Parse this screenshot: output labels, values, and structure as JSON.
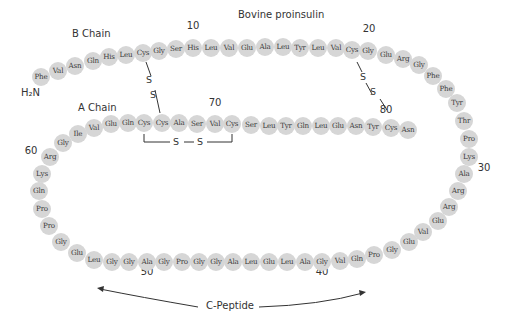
{
  "title": "Bovine proinsulin",
  "labels": {
    "b_chain": "B Chain",
    "a_chain": "A Chain",
    "n_terminus": "H₂N",
    "c_peptide": "C-Peptide",
    "disulfide_atom": "S"
  },
  "position_numbers": [
    {
      "text": "10",
      "x": 193,
      "y": 26
    },
    {
      "text": "20",
      "x": 369,
      "y": 29
    },
    {
      "text": "30",
      "x": 484,
      "y": 168
    },
    {
      "text": "40",
      "x": 322,
      "y": 272
    },
    {
      "text": "50",
      "x": 147,
      "y": 272
    },
    {
      "text": "60",
      "x": 31,
      "y": 151
    },
    {
      "text": "70",
      "x": 215,
      "y": 103
    },
    {
      "text": "80",
      "x": 386,
      "y": 110
    }
  ],
  "residues_outer": [
    {
      "aa": "Phe",
      "x": 41,
      "y": 77
    },
    {
      "aa": "Val",
      "x": 58,
      "y": 71
    },
    {
      "aa": "Asn",
      "x": 75,
      "y": 66
    },
    {
      "aa": "Gln",
      "x": 93,
      "y": 61
    },
    {
      "aa": "His",
      "x": 109,
      "y": 57
    },
    {
      "aa": "Leu",
      "x": 126,
      "y": 55
    },
    {
      "aa": "Cys",
      "x": 143,
      "y": 53
    },
    {
      "aa": "Gly",
      "x": 159,
      "y": 51
    },
    {
      "aa": "Ser",
      "x": 176,
      "y": 49
    },
    {
      "aa": "His",
      "x": 193,
      "y": 48
    },
    {
      "aa": "Leu",
      "x": 211,
      "y": 48
    },
    {
      "aa": "Val",
      "x": 229,
      "y": 48
    },
    {
      "aa": "Glu",
      "x": 247,
      "y": 48
    },
    {
      "aa": "Ala",
      "x": 265,
      "y": 47
    },
    {
      "aa": "Leu",
      "x": 283,
      "y": 47
    },
    {
      "aa": "Tyr",
      "x": 300,
      "y": 48
    },
    {
      "aa": "Leu",
      "x": 318,
      "y": 48
    },
    {
      "aa": "Val",
      "x": 336,
      "y": 48
    },
    {
      "aa": "Cys",
      "x": 352,
      "y": 50
    },
    {
      "aa": "Gly",
      "x": 368,
      "y": 51
    },
    {
      "aa": "Glu",
      "x": 386,
      "y": 55
    },
    {
      "aa": "Arg",
      "x": 403,
      "y": 59
    },
    {
      "aa": "Gly",
      "x": 419,
      "y": 65
    },
    {
      "aa": "Phe",
      "x": 433,
      "y": 76
    },
    {
      "aa": "Phe",
      "x": 446,
      "y": 89
    },
    {
      "aa": "Tyr",
      "x": 457,
      "y": 103
    },
    {
      "aa": "Thr",
      "x": 464,
      "y": 121
    },
    {
      "aa": "Pro",
      "x": 469,
      "y": 139
    },
    {
      "aa": "Lys",
      "x": 469,
      "y": 157
    },
    {
      "aa": "Ala",
      "x": 464,
      "y": 174
    },
    {
      "aa": "Arg",
      "x": 458,
      "y": 191
    },
    {
      "aa": "Arg",
      "x": 449,
      "y": 207
    },
    {
      "aa": "Glu",
      "x": 438,
      "y": 221
    },
    {
      "aa": "Val",
      "x": 423,
      "y": 232
    },
    {
      "aa": "Glu",
      "x": 409,
      "y": 242
    },
    {
      "aa": "Gly",
      "x": 392,
      "y": 250
    },
    {
      "aa": "Pro",
      "x": 374,
      "y": 255
    },
    {
      "aa": "Gln",
      "x": 357,
      "y": 259
    },
    {
      "aa": "Val",
      "x": 340,
      "y": 261
    },
    {
      "aa": "Gly",
      "x": 322,
      "y": 262
    },
    {
      "aa": "Ala",
      "x": 305,
      "y": 262
    },
    {
      "aa": "Leu",
      "x": 287,
      "y": 262
    },
    {
      "aa": "Glu",
      "x": 269,
      "y": 262
    },
    {
      "aa": "Leu",
      "x": 251,
      "y": 262
    },
    {
      "aa": "Ala",
      "x": 233,
      "y": 262
    },
    {
      "aa": "Gly",
      "x": 216,
      "y": 262
    },
    {
      "aa": "Gly",
      "x": 199,
      "y": 262
    },
    {
      "aa": "Pro",
      "x": 182,
      "y": 262
    },
    {
      "aa": "Gly",
      "x": 164,
      "y": 262
    },
    {
      "aa": "Ala",
      "x": 147,
      "y": 262
    },
    {
      "aa": "Gly",
      "x": 129,
      "y": 262
    },
    {
      "aa": "Gly",
      "x": 112,
      "y": 262
    },
    {
      "aa": "Leu",
      "x": 94,
      "y": 260
    },
    {
      "aa": "Glu",
      "x": 77,
      "y": 253
    },
    {
      "aa": "Gly",
      "x": 61,
      "y": 242
    },
    {
      "aa": "Pro",
      "x": 49,
      "y": 226
    },
    {
      "aa": "Pro",
      "x": 42,
      "y": 209
    },
    {
      "aa": "Gln",
      "x": 39,
      "y": 191
    },
    {
      "aa": "Lys",
      "x": 42,
      "y": 174
    },
    {
      "aa": "Arg",
      "x": 50,
      "y": 157
    },
    {
      "aa": "Gly",
      "x": 63,
      "y": 143
    },
    {
      "aa": "Ile",
      "x": 78,
      "y": 134
    }
  ],
  "residues_a_row": [
    {
      "aa": "Val",
      "x": 94,
      "y": 128
    },
    {
      "aa": "Glu",
      "x": 111,
      "y": 124
    },
    {
      "aa": "Gln",
      "x": 128,
      "y": 123
    },
    {
      "aa": "Cys",
      "x": 144,
      "y": 123
    },
    {
      "aa": "Cys",
      "x": 162,
      "y": 123
    },
    {
      "aa": "Ala",
      "x": 179,
      "y": 123
    },
    {
      "aa": "Ser",
      "x": 197,
      "y": 124
    },
    {
      "aa": "Val",
      "x": 215,
      "y": 124
    },
    {
      "aa": "Cys",
      "x": 232,
      "y": 124
    },
    {
      "aa": "Ser",
      "x": 251,
      "y": 125
    },
    {
      "aa": "Leu",
      "x": 269,
      "y": 126
    },
    {
      "aa": "Tyr",
      "x": 286,
      "y": 126
    },
    {
      "aa": "Gln",
      "x": 303,
      "y": 126
    },
    {
      "aa": "Leu",
      "x": 321,
      "y": 126
    },
    {
      "aa": "Glu",
      "x": 338,
      "y": 126
    },
    {
      "aa": "Asn",
      "x": 356,
      "y": 126
    },
    {
      "aa": "Tyr",
      "x": 373,
      "y": 127
    },
    {
      "aa": "Cys",
      "x": 391,
      "y": 128
    },
    {
      "aa": "Asn",
      "x": 408,
      "y": 130
    }
  ],
  "colors": {
    "residue_fill": "#d6d6d6",
    "text": "#333333",
    "line": "#333333"
  }
}
